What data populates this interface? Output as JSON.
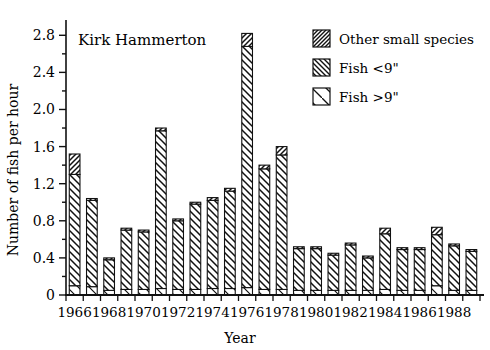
{
  "chart_data": {
    "type": "bar",
    "subtype": "stacked-bar",
    "title": "Kirk Hammerton",
    "xlabel": "Year",
    "ylabel": "Number of fish per hour",
    "ylim": [
      0,
      2.9
    ],
    "ytick_values": [
      0,
      0.4,
      0.8,
      1.2,
      1.6,
      2.0,
      2.4,
      2.8
    ],
    "ytick_labels": [
      "0",
      "0.4",
      "0.8",
      "1.2",
      "1.6",
      "2.0",
      "2.4",
      "2.8"
    ],
    "yminor_step": 0.2,
    "grid": false,
    "legend_position": "top-right",
    "categories": [
      1966,
      1967,
      1968,
      1969,
      1970,
      1971,
      1972,
      1973,
      1974,
      1975,
      1976,
      1977,
      1978,
      1979,
      1980,
      1981,
      1982,
      1983,
      1984,
      1985,
      1986,
      1987,
      1988,
      1989
    ],
    "xtick_labels": [
      "1966",
      "1968",
      "1970",
      "1972",
      "1974",
      "1976",
      "1978",
      "1980",
      "1982",
      "1984",
      "1986",
      "1988"
    ],
    "xtick_step": 2,
    "series": [
      {
        "name": "Fish >9\"",
        "pattern": "sparse-diagonal",
        "values": [
          0.1,
          0.09,
          0.05,
          0.06,
          0.06,
          0.07,
          0.06,
          0.06,
          0.07,
          0.07,
          0.08,
          0.06,
          0.06,
          0.05,
          0.05,
          0.05,
          0.05,
          0.05,
          0.06,
          0.05,
          0.05,
          0.1,
          0.05,
          0.05
        ]
      },
      {
        "name": "Fish <9\"",
        "pattern": "medium-forward-slash",
        "values": [
          1.2,
          0.93,
          0.33,
          0.64,
          0.62,
          1.7,
          0.74,
          0.92,
          0.95,
          1.05,
          2.6,
          1.3,
          1.45,
          0.45,
          0.45,
          0.38,
          0.49,
          0.35,
          0.6,
          0.44,
          0.44,
          0.55,
          0.48,
          0.42
        ]
      },
      {
        "name": "Other small species",
        "pattern": "dense-back-slash",
        "values": [
          0.22,
          0.02,
          0.02,
          0.02,
          0.02,
          0.03,
          0.02,
          0.02,
          0.03,
          0.03,
          0.14,
          0.04,
          0.09,
          0.02,
          0.02,
          0.02,
          0.02,
          0.02,
          0.06,
          0.02,
          0.02,
          0.08,
          0.02,
          0.02
        ]
      }
    ],
    "totals": [
      1.52,
      1.04,
      0.4,
      0.72,
      0.7,
      1.8,
      0.82,
      1.0,
      1.05,
      1.15,
      2.82,
      1.4,
      1.6,
      0.52,
      0.52,
      0.45,
      0.56,
      0.42,
      0.72,
      0.51,
      0.51,
      0.73,
      0.55,
      0.49
    ]
  },
  "legend": {
    "items": [
      {
        "label": "Other small species",
        "pattern": "dense-back-slash"
      },
      {
        "label": "Fish <9\"",
        "pattern": "medium-forward-slash"
      },
      {
        "label": "Fish >9\"",
        "pattern": "sparse-diagonal"
      }
    ]
  },
  "colors": {
    "axis": "#111111",
    "bar_stroke": "#111111",
    "bar_fill": "#ffffff",
    "hatch": "#111111",
    "background": "#ffffff"
  }
}
